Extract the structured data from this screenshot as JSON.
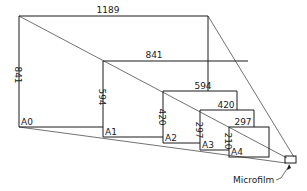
{
  "diagram": {
    "type": "paper-size-projection",
    "sheets": [
      {
        "name": "A0",
        "width_label": "1189",
        "height_label": "841"
      },
      {
        "name": "A1",
        "width_label": "841",
        "height_label": "594"
      },
      {
        "name": "A2",
        "width_label": "594",
        "height_label": "420"
      },
      {
        "name": "A3",
        "width_label": "420",
        "height_label": "297"
      },
      {
        "name": "A4",
        "width_label": "297",
        "height_label": "210"
      }
    ],
    "callout": "Microfilm"
  },
  "colors": {
    "line": "#1a1a1a",
    "background": "#ffffff"
  }
}
